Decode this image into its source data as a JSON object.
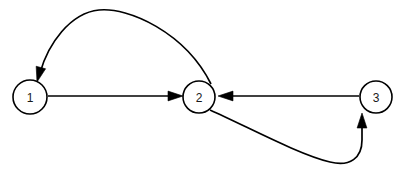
{
  "figure": {
    "name": "directed-graph",
    "type": "node-link-diagram",
    "background_color": "#ffffff",
    "stroke_color": "#000000",
    "label_color": "#1a1a1a",
    "width": 402,
    "height": 179
  },
  "nodes": [
    {
      "id": "1",
      "label": "1",
      "cx": 30,
      "cy": 97,
      "r": 17
    },
    {
      "id": "2",
      "label": "2",
      "cx": 199,
      "cy": 97,
      "r": 16
    },
    {
      "id": "3",
      "label": "3",
      "cx": 376,
      "cy": 97,
      "r": 16
    }
  ],
  "edges": [
    {
      "id": "edge-1-to-2",
      "from": "1",
      "to": "2",
      "label": "",
      "shape": "straight",
      "path": "M 48 96 L 177 96",
      "arrow_tip": {
        "x": 183,
        "y": 96
      },
      "arrow_angle": 0
    },
    {
      "id": "edge-2-to-1",
      "from": "2",
      "to": "1",
      "label": "",
      "shape": "curved-over-top",
      "path": "M 211 84 C 185 32 128 7 99 10 C 70 13 48 44 40 73",
      "arrow_tip": {
        "x": 37,
        "y": 82
      },
      "arrow_angle": 105
    },
    {
      "id": "edge-3-to-2",
      "from": "3",
      "to": "2",
      "label": "",
      "shape": "straight",
      "path": "M 359 96 L 227 96",
      "arrow_tip": {
        "x": 218,
        "y": 96
      },
      "arrow_angle": 180
    },
    {
      "id": "edge-2-to-3",
      "from": "2",
      "to": "3",
      "label": "",
      "shape": "curved-under-bottom",
      "path": "M 210 110 C 250 128 300 155 330 162 C 350 167 362 158 362 140 L 362 125",
      "arrow_tip": {
        "x": 362,
        "y": 113
      },
      "arrow_angle": 270
    }
  ],
  "legend": {
    "visible": false,
    "entries": []
  },
  "chart_data": {
    "type": "table",
    "title": "",
    "xlabel": "",
    "ylabel": "",
    "categories": [
      "1",
      "2",
      "3"
    ],
    "series": [
      {
        "name": "node-degree-out",
        "values": [
          1,
          2,
          1
        ]
      },
      {
        "name": "node-degree-in",
        "values": [
          1,
          2,
          1
        ]
      }
    ],
    "adjacency": [
      [
        "1",
        "2"
      ],
      [
        "2",
        "1"
      ],
      [
        "2",
        "3"
      ],
      [
        "3",
        "2"
      ]
    ]
  }
}
